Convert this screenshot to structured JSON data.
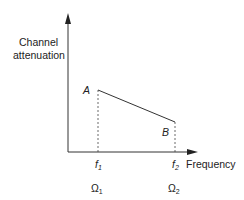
{
  "diagram": {
    "y_axis_label_line1": "Channel",
    "y_axis_label_line2": "attenuation",
    "x_axis_label": "Frequency",
    "point_a": "A",
    "point_b": "B",
    "tick1_f": "f",
    "tick1_f_sub": "1",
    "tick2_f": "f",
    "tick2_f_sub": "2",
    "tick1_omega": "Ω",
    "tick1_omega_sub": "1",
    "tick2_omega": "Ω",
    "tick2_omega_sub": "2",
    "line_color": "#333333"
  }
}
